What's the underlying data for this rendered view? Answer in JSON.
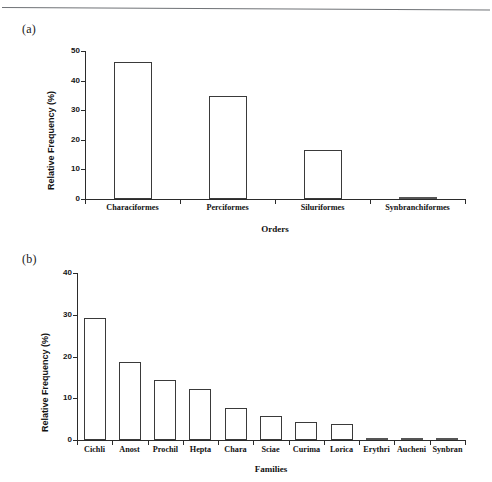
{
  "figure": {
    "panel_a_letter": "(a)",
    "panel_b_letter": "(b)"
  },
  "chart_data": [
    {
      "id": "panel-a",
      "type": "bar",
      "title": "",
      "panel_label": "(a)",
      "xlabel": "Orders",
      "ylabel": "Relative Frequency (%)",
      "ylim": [
        0,
        50
      ],
      "yticks": [
        0,
        10,
        20,
        30,
        40,
        50
      ],
      "ytick_labels": [
        "0",
        "10",
        "20",
        "30",
        "40",
        "50"
      ],
      "grid": false,
      "legend": "none",
      "categories": [
        "Characiformes",
        "Perciformes",
        "Siluriformes",
        "Synbranchiformes"
      ],
      "values": [
        46.3,
        34.8,
        16.5,
        0.5
      ],
      "bar_style": {
        "fill": "#ffffff",
        "edge": "#3a3a3a"
      }
    },
    {
      "id": "panel-b",
      "type": "bar",
      "title": "",
      "panel_label": "(b)",
      "xlabel": "Families",
      "ylabel": "Relative Frequency (%)",
      "ylim": [
        0,
        40
      ],
      "yticks": [
        0,
        10,
        20,
        30,
        40
      ],
      "ytick_labels": [
        "0",
        "10",
        "20",
        "30",
        "40"
      ],
      "grid": false,
      "legend": "none",
      "categories": [
        "Cichli",
        "Anost",
        "Prochil",
        "Hepta",
        "Chara",
        "Sciae",
        "Curima",
        "Lorica",
        "Erythri",
        "Aucheni",
        "Synbran"
      ],
      "values": [
        29.3,
        18.6,
        14.4,
        12.2,
        7.6,
        5.7,
        4.2,
        3.9,
        0.5,
        0.5,
        0.5
      ],
      "bar_style": {
        "fill": "#ffffff",
        "edge": "#3a3a3a"
      }
    }
  ]
}
